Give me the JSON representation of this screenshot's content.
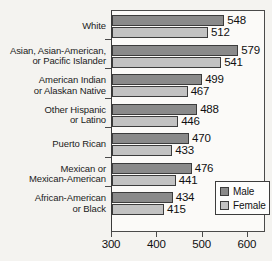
{
  "chart_data": {
    "type": "bar",
    "orientation": "horizontal",
    "title": "",
    "xlabel": "",
    "ylabel": "",
    "xlim": [
      300,
      640
    ],
    "xticks": [
      300,
      400,
      500,
      600
    ],
    "xtick_labels": [
      "300",
      "400",
      "500",
      "600"
    ],
    "grid": false,
    "legend_position": "inside-bottom-right",
    "categories": [
      "White",
      "Asian, Asian-American,\nor Pacific Islander",
      "American Indian\nor Alaskan Native",
      "Other Hispanic\nor Latino",
      "Puerto Rican",
      "Mexican or\nMexican-American",
      "African-American\nor Black"
    ],
    "series": [
      {
        "name": "Male",
        "color": "#8a8a8a",
        "values": [
          548,
          579,
          499,
          488,
          470,
          476,
          434
        ]
      },
      {
        "name": "Female",
        "color": "#c2c2c2",
        "values": [
          512,
          541,
          467,
          446,
          433,
          441,
          415
        ]
      }
    ]
  },
  "categories": [
    {
      "line1": "White",
      "line2": ""
    },
    {
      "line1": "Asian, Asian-American,",
      "line2": "or Pacific Islander"
    },
    {
      "line1": "American Indian",
      "line2": "or Alaskan Native"
    },
    {
      "line1": "Other Hispanic",
      "line2": "or Latino"
    },
    {
      "line1": "Puerto Rican",
      "line2": ""
    },
    {
      "line1": "Mexican or",
      "line2": "Mexican-American"
    },
    {
      "line1": "African-American",
      "line2": "or Black"
    }
  ],
  "values": {
    "male": [
      "548",
      "579",
      "499",
      "488",
      "470",
      "476",
      "434"
    ],
    "female": [
      "512",
      "541",
      "467",
      "446",
      "433",
      "441",
      "415"
    ]
  },
  "xaxis": {
    "labels": [
      "300",
      "400",
      "500",
      "600"
    ]
  },
  "legend": {
    "male_label": "Male",
    "female_label": "Female"
  },
  "colors": {
    "male_bar": "#8a8a8a",
    "female_bar": "#c2c2c2",
    "axis": "#4a4a4a",
    "background": "#f4f3f0"
  }
}
